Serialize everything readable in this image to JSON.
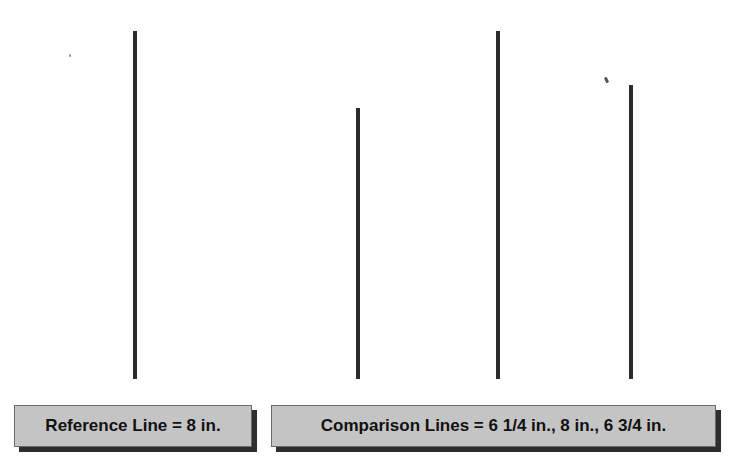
{
  "diagram": {
    "line_color": "#2b2b2b",
    "box_fill": "#c4c4c4",
    "box_shadow": "#2e2e2e",
    "lines": [
      {
        "id": "reference",
        "length_in": "8",
        "x": 133,
        "top": 31,
        "bottom": 379
      },
      {
        "id": "comparison-1",
        "length_in": "6 1/4",
        "x": 356,
        "top": 108,
        "bottom": 379
      },
      {
        "id": "comparison-2",
        "length_in": "8",
        "x": 496,
        "top": 31,
        "bottom": 379
      },
      {
        "id": "comparison-3",
        "length_in": "6 3/4",
        "x": 629,
        "top": 85,
        "bottom": 379
      }
    ]
  },
  "labels": {
    "reference": "Reference Line = 8 in.",
    "comparison": "Comparison Lines = 6 1/4 in., 8 in., 6 3/4 in."
  }
}
